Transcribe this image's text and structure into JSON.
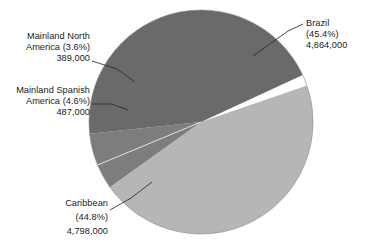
{
  "chart_data": {
    "type": "pie",
    "title": "",
    "subtitle": "",
    "xlabel": "",
    "ylabel": "",
    "legend_position": "none",
    "grid": false,
    "total": 10538000,
    "categories": [
      "Brazil",
      "Mainland North America",
      "Mainland Spanish America",
      "Caribbean"
    ],
    "values": [
      4864000,
      389000,
      487000,
      4798000
    ],
    "percentages": [
      45.4,
      3.6,
      4.6,
      44.8
    ],
    "slices": [
      {
        "name": "Brazil",
        "label_line1": "Brazil",
        "label_line2": "(45.4%)",
        "label_line3": "4,864,000",
        "percent": 45.4,
        "value": 4864000,
        "value_text": "4,864,000",
        "percent_text": "(45.4%)",
        "color": "#b6b6b6"
      },
      {
        "name": "Mainland North America",
        "label_line1": "Mainland North",
        "label_line2": "America (3.6%)",
        "label_line3": "389,000",
        "percent": 3.6,
        "value": 389000,
        "value_text": "389,000",
        "percent_text": "(3.6%)",
        "color": "#7d7d7d"
      },
      {
        "name": "Mainland Spanish America",
        "label_line1": "Mainland Spanish",
        "label_line2": "America (4.6%)",
        "label_line3": "487,000",
        "percent": 4.6,
        "value": 487000,
        "value_text": "487,000",
        "percent_text": "(4.6%)",
        "color": "#7d7d7d"
      },
      {
        "name": "Caribbean",
        "label_line1": "Caribbean",
        "label_line2": "(44.8%)",
        "label_line3": "4,798,000",
        "percent": 44.8,
        "value": 4798000,
        "value_text": "4,798,000",
        "percent_text": "(44.8%)",
        "color": "#6a6a6a"
      }
    ],
    "colors": {
      "brazil": "#b6b6b6",
      "mainland_north_america": "#7d7d7d",
      "mainland_spanish_america": "#7d7d7d",
      "caribbean": "#6a6a6a",
      "background": "#ffffff",
      "text": "#1a1a1a",
      "leader_line": "#2b2b2b"
    }
  }
}
